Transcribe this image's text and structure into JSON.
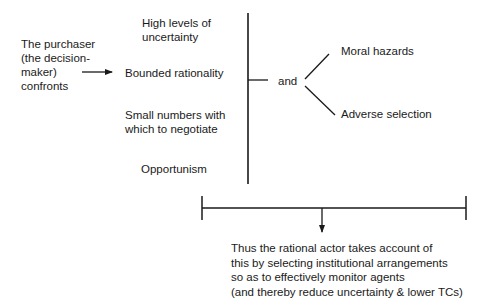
{
  "diagram": {
    "actor": {
      "lines": [
        "The purchaser",
        "(the decision-",
        "maker)",
        "confronts"
      ]
    },
    "conditions": [
      {
        "lines": [
          "High levels of",
          "uncertainty"
        ]
      },
      {
        "lines": [
          "Bounded rationality"
        ]
      },
      {
        "lines": [
          "Small numbers with",
          "which to negotiate"
        ]
      },
      {
        "lines": [
          "Opportunism"
        ]
      }
    ],
    "connector_label": "and",
    "outcomes": [
      {
        "label": "Moral hazards"
      },
      {
        "label": "Adverse selection"
      }
    ],
    "conclusion": {
      "lines": [
        "Thus the rational actor takes account of",
        "this by selecting institutional arrangements",
        "so as to effectively monitor agents",
        "(and thereby reduce uncertainty & lower TCs)"
      ]
    },
    "line_color": "#1a1a1a"
  }
}
